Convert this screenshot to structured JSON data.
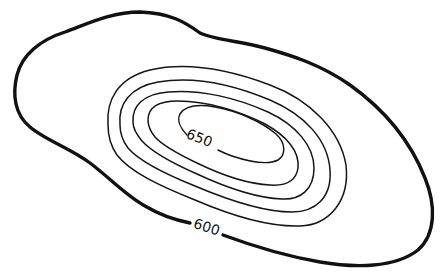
{
  "map": {
    "type": "topographic-contour-sketch",
    "feature": "elongated hill",
    "background_color": "#ffffff",
    "line_color": "#111111",
    "contour_interval": 10,
    "contours": [
      {
        "level": 600,
        "labeled": true,
        "label": "600",
        "style": "index-bold"
      },
      {
        "level": 610,
        "labeled": false
      },
      {
        "level": 620,
        "labeled": false
      },
      {
        "level": 630,
        "labeled": false
      },
      {
        "level": 640,
        "labeled": false
      },
      {
        "level": 650,
        "labeled": true,
        "label": "650",
        "style": "thin"
      }
    ],
    "labels": {
      "outer": "600",
      "inner": "650"
    }
  }
}
